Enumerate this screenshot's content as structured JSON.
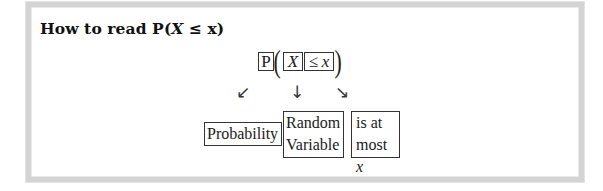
{
  "heading": {
    "prefix": "How to read P(",
    "variable": "X",
    "suffix": " ≤ x)"
  },
  "formula": {
    "function_symbol": "P",
    "open_paren": "(",
    "random_variable": "X",
    "relation": "≤",
    "value_variable": "x",
    "close_paren": ")"
  },
  "arrows": {
    "left": "↙",
    "middle": "↓",
    "right": "↘"
  },
  "labels": {
    "probability": "Probability",
    "random_variable_line1": "Random",
    "random_variable_line2": "Variable",
    "at_most_line1": "is at",
    "at_most_line2_prefix": "most ",
    "at_most_line2_var": "x"
  },
  "colors": {
    "frame_border": "#d4d4d4",
    "box_border": "#333333",
    "text": "#111111"
  }
}
